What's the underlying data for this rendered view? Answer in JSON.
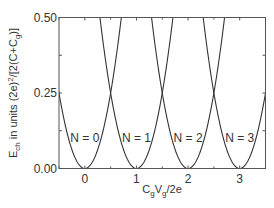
{
  "chart_data": {
    "type": "line",
    "title": "",
    "xlabel": "CgVg/2e",
    "xlabel_parts": {
      "c": "C",
      "c_sub": "g",
      "v": "V",
      "v_sub": "g",
      "rest": "/2e"
    },
    "ylabel": "Ech in units (2e)^2/[2(C+Cg)]",
    "ylabel_parts": {
      "e": "E",
      "e_sub": "ch",
      "mid": " in units (2e)",
      "sup": "2",
      "tail": "/[2(C+C",
      "tail_sub": "g",
      "end": ")]"
    },
    "xlim": [
      -0.5,
      3.5
    ],
    "ylim": [
      0.0,
      0.5
    ],
    "xticks": [
      0,
      1,
      2,
      3
    ],
    "xtick_labels": [
      "0",
      "1",
      "2",
      "3"
    ],
    "xminor_ticks": [
      -0.5,
      0.5,
      1.5,
      2.5,
      3.5
    ],
    "yticks": [
      0.0,
      0.125,
      0.25,
      0.375,
      0.5
    ],
    "ytick_labels": [
      "0.00",
      "",
      "0.25",
      "",
      "0.50"
    ],
    "grid": false,
    "legend": null,
    "series": [
      {
        "name": "N = 0",
        "formula": "(x-0)^2",
        "center": 0,
        "x": [
          -0.5,
          -0.25,
          0,
          0.25,
          0.5,
          0.707
        ],
        "values": [
          0.25,
          0.0625,
          0,
          0.0625,
          0.25,
          0.5
        ]
      },
      {
        "name": "N = 1",
        "formula": "(x-1)^2",
        "center": 1,
        "x": [
          0.293,
          0.5,
          0.75,
          1,
          1.25,
          1.5,
          1.707
        ],
        "values": [
          0.5,
          0.25,
          0.0625,
          0,
          0.0625,
          0.25,
          0.5
        ]
      },
      {
        "name": "N = 2",
        "formula": "(x-2)^2",
        "center": 2,
        "x": [
          1.293,
          1.5,
          1.75,
          2,
          2.25,
          2.5,
          2.707
        ],
        "values": [
          0.5,
          0.25,
          0.0625,
          0,
          0.0625,
          0.25,
          0.5
        ]
      },
      {
        "name": "N = 3",
        "formula": "(x-3)^2",
        "center": 3,
        "x": [
          2.293,
          2.5,
          2.75,
          3,
          3.25,
          3.5
        ],
        "values": [
          0.5,
          0.25,
          0.0625,
          0,
          0.0625,
          0.25
        ]
      }
    ],
    "annotations": [
      {
        "text": "N = 0",
        "x": 0,
        "y": 0.1
      },
      {
        "text": "N = 1",
        "x": 1,
        "y": 0.1
      },
      {
        "text": "N = 2",
        "x": 2,
        "y": 0.1
      },
      {
        "text": "N = 3",
        "x": 3,
        "y": 0.1
      }
    ]
  },
  "style": {
    "line_color": "#333333",
    "axis_color": "#555555",
    "text_color": "#333333"
  }
}
